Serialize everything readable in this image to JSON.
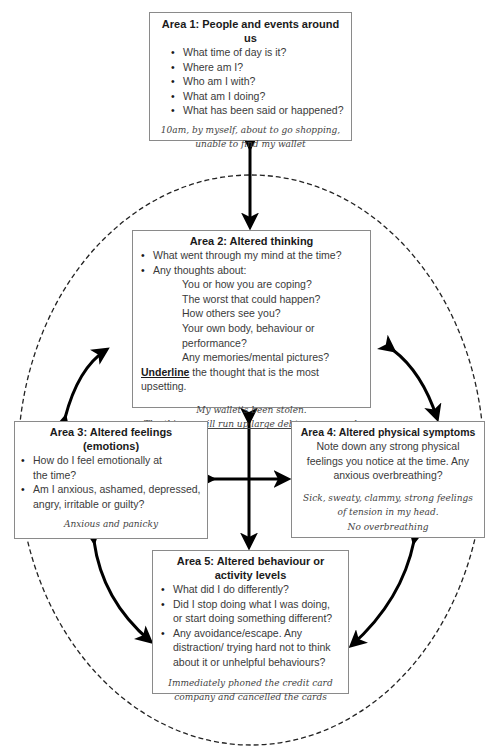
{
  "area1": {
    "title": "Area 1: People and events around us",
    "questions": [
      "What time of day is it?",
      "Where am I?",
      "Who am I with?",
      "What am I doing?",
      "What has been said or happened?"
    ],
    "answer": "10am, by myself, about to go shopping, unable to find my wallet"
  },
  "area2": {
    "title": "Area 2: Altered thinking",
    "questions": [
      "What went through my mind at the time?",
      "Any thoughts about:"
    ],
    "sub_questions": [
      "You or how you are coping?",
      "The worst that could happen?",
      "How others see you?",
      "Your own body, behaviour or performance?",
      "Any memories/mental pictures?"
    ],
    "instruction_bold": "Underline",
    "instruction_rest": " the thought that is the most upsetting.",
    "answer_line1": "My wallet's been stolen.",
    "answer_line2": "The thieves will run up large debts on my card."
  },
  "area3": {
    "title_line1": "Area 3: Altered feelings",
    "title_line2": "(emotions)",
    "questions": [
      "How do I feel emotionally at the time?",
      "Am I anxious, ashamed, depressed, angry, irritable or guilty?"
    ],
    "answer": "Anxious and panicky"
  },
  "area4": {
    "title": "Area 4: Altered physical symptoms",
    "prompt": "Note down any strong physical feelings you notice at the time. Any anxious overbreathing?",
    "answer_line1": "Sick, sweaty, clammy, strong feelings of tension in my head.",
    "answer_line2": "No overbreathing"
  },
  "area5": {
    "title_line1": "Area 5: Altered behaviour or",
    "title_line2": "activity levels",
    "questions": [
      "What did I do differently?",
      "Did I stop doing what I was doing, or start doing something different?",
      "Any avoidance/escape. Any distraction/ trying hard not to think about it or unhelpful behaviours?"
    ],
    "answer": "Immediately phoned the credit card company and cancelled the cards"
  }
}
